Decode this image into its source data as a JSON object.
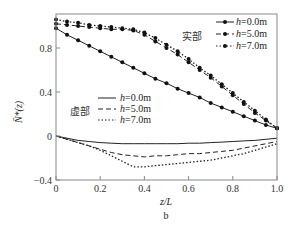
{
  "chart_data": {
    "type": "line",
    "title": "",
    "xlabel": "z/L",
    "ylabel": "N̄*(z)",
    "panel_label": "b",
    "xlim": [
      0,
      1.0
    ],
    "ylim": [
      -0.4,
      1.11
    ],
    "xticks": [
      "0",
      "0.2",
      "0.4",
      "0.6",
      "0.8",
      "1.0"
    ],
    "yticks": [
      "−0.4",
      "0",
      "0.4",
      "0.8"
    ],
    "grid": false,
    "x": [
      0,
      0.05,
      0.1,
      0.15,
      0.2,
      0.25,
      0.3,
      0.35,
      0.4,
      0.45,
      0.5,
      0.55,
      0.6,
      0.65,
      0.7,
      0.75,
      0.8,
      0.85,
      0.9,
      0.95,
      1.0
    ],
    "legend_groups": [
      {
        "group": "实部",
        "position": "upper right"
      },
      {
        "group": "虚部",
        "position": "center left"
      }
    ],
    "series": [
      {
        "name": "实部 h=0.0m",
        "group": "实部",
        "style": "solid",
        "marker": "circle",
        "values": [
          0.98,
          0.92,
          0.87,
          0.82,
          0.77,
          0.72,
          0.67,
          0.62,
          0.57,
          0.52,
          0.48,
          0.43,
          0.39,
          0.35,
          0.3,
          0.26,
          0.22,
          0.18,
          0.14,
          0.1,
          0.07
        ]
      },
      {
        "name": "实部 h=5.0m",
        "group": "实部",
        "style": "dashed",
        "marker": "circle",
        "values": [
          1.02,
          1.01,
          1.0,
          0.99,
          0.98,
          0.97,
          0.97,
          0.96,
          0.92,
          0.86,
          0.8,
          0.74,
          0.67,
          0.6,
          0.53,
          0.45,
          0.37,
          0.29,
          0.21,
          0.14,
          0.07
        ]
      },
      {
        "name": "实部 h=7.0m",
        "group": "实部",
        "style": "dotted",
        "marker": "circle",
        "values": [
          1.06,
          1.04,
          1.03,
          1.01,
          1.0,
          0.99,
          0.98,
          0.97,
          0.94,
          0.89,
          0.83,
          0.77,
          0.7,
          0.62,
          0.55,
          0.47,
          0.39,
          0.31,
          0.23,
          0.15,
          0.07
        ]
      },
      {
        "name": "虚部 h=0.0m",
        "group": "虚部",
        "style": "solid",
        "marker": "none",
        "values": [
          0.0,
          -0.02,
          -0.04,
          -0.05,
          -0.06,
          -0.065,
          -0.07,
          -0.07,
          -0.07,
          -0.07,
          -0.07,
          -0.07,
          -0.065,
          -0.065,
          -0.06,
          -0.055,
          -0.05,
          -0.045,
          -0.04,
          -0.03,
          -0.02
        ]
      },
      {
        "name": "虚部 h=5.0m",
        "group": "虚部",
        "style": "dashed",
        "marker": "none",
        "values": [
          0.0,
          -0.03,
          -0.06,
          -0.09,
          -0.12,
          -0.15,
          -0.17,
          -0.18,
          -0.19,
          -0.18,
          -0.18,
          -0.17,
          -0.16,
          -0.16,
          -0.15,
          -0.14,
          -0.13,
          -0.11,
          -0.09,
          -0.07,
          -0.05
        ]
      },
      {
        "name": "虚部 h=7.0m",
        "group": "虚部",
        "style": "dotted",
        "marker": "none",
        "values": [
          0.0,
          -0.03,
          -0.06,
          -0.09,
          -0.13,
          -0.18,
          -0.23,
          -0.28,
          -0.28,
          -0.27,
          -0.26,
          -0.25,
          -0.24,
          -0.23,
          -0.22,
          -0.2,
          -0.18,
          -0.16,
          -0.13,
          -0.1,
          -0.07
        ]
      }
    ]
  },
  "labels": {
    "real_group": "实部",
    "imag_group": "虚部",
    "legend_real": [
      "h=0.0m",
      "h=5.0m",
      "h=7.0m"
    ],
    "legend_imag": [
      "h=0.0m",
      "h=5.0m",
      "h=7.0m"
    ],
    "xlabel": "z/L",
    "panel": "b"
  }
}
